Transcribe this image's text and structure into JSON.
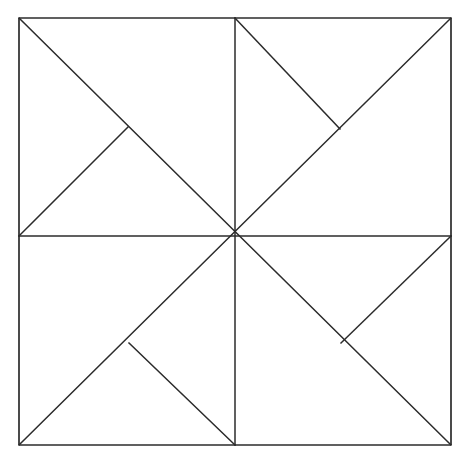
{
  "figure": {
    "background_color": "#ffffff",
    "stroke_color": "#2b2b2b",
    "stroke_width": 1.5,
    "canvas": {
      "width": 474,
      "height": 469
    },
    "square": {
      "left": 19,
      "top": 18,
      "right": 451,
      "bottom": 445,
      "width": 432,
      "height": 427
    },
    "center": {
      "x": 235,
      "y": 236
    },
    "symmetry": "4-fold rotational (C4)",
    "vertices": {
      "top_left": {
        "x": 19,
        "y": 18
      },
      "top_right": {
        "x": 451,
        "y": 18
      },
      "bottom_right": {
        "x": 451,
        "y": 445
      },
      "bottom_left": {
        "x": 19,
        "y": 445
      },
      "top_mid": {
        "x": 235,
        "y": 18
      },
      "right_mid": {
        "x": 451,
        "y": 236
      },
      "bottom_mid": {
        "x": 235,
        "y": 445
      },
      "left_mid": {
        "x": 19,
        "y": 236
      },
      "elbow_top_left": {
        "x": 128,
        "y": 127
      },
      "elbow_top_right": {
        "x": 340,
        "y": 129
      },
      "elbow_bottom_left": {
        "x": 129,
        "y": 343
      },
      "elbow_bottom_right": {
        "x": 341,
        "y": 343
      }
    },
    "segments": [
      {
        "name": "border-top",
        "x1": 19,
        "y1": 18,
        "x2": 451,
        "y2": 18
      },
      {
        "name": "border-right",
        "x1": 451,
        "y1": 18,
        "x2": 451,
        "y2": 445
      },
      {
        "name": "border-bottom",
        "x1": 451,
        "y1": 445,
        "x2": 19,
        "y2": 445
      },
      {
        "name": "border-left",
        "x1": 19,
        "y1": 445,
        "x2": 19,
        "y2": 18
      },
      {
        "name": "midline-vertical",
        "x1": 235,
        "y1": 18,
        "x2": 235,
        "y2": 445
      },
      {
        "name": "midline-horizontal",
        "x1": 19,
        "y1": 236,
        "x2": 451,
        "y2": 236
      },
      {
        "name": "diagonal-main",
        "x1": 19,
        "y1": 18,
        "x2": 451,
        "y2": 445
      },
      {
        "name": "diagonal-anti",
        "x1": 451,
        "y1": 18,
        "x2": 19,
        "y2": 445
      },
      {
        "name": "elbow-top-left",
        "x1": 128,
        "y1": 127,
        "x2": 19,
        "y2": 236
      },
      {
        "name": "elbow-top-right",
        "x1": 340,
        "y1": 129,
        "x2": 235,
        "y2": 18
      },
      {
        "name": "elbow-bottom-left",
        "x1": 129,
        "y1": 343,
        "x2": 235,
        "y2": 445
      },
      {
        "name": "elbow-bottom-right",
        "x1": 341,
        "y1": 343,
        "x2": 451,
        "y2": 236
      }
    ]
  }
}
